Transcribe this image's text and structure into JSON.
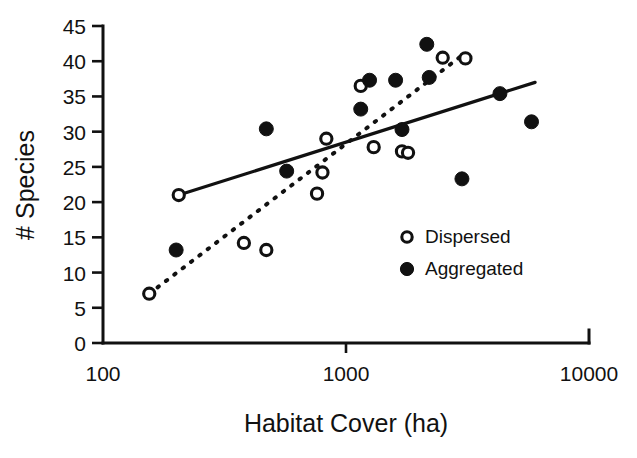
{
  "chart_data": {
    "type": "scatter",
    "title": "",
    "xlabel": "Habitat Cover (ha)",
    "ylabel": "# Species",
    "xscale": "log",
    "xlim": [
      100,
      10000
    ],
    "ylim": [
      0,
      45
    ],
    "xticks": [
      100,
      1000,
      10000
    ],
    "xtick_labels": [
      "100",
      "1000",
      "10000"
    ],
    "yticks": [
      0,
      5,
      10,
      15,
      20,
      25,
      30,
      35,
      40,
      45
    ],
    "ytick_labels": [
      "0",
      "5",
      "10",
      "15",
      "20",
      "25",
      "30",
      "35",
      "40",
      "45"
    ],
    "grid": false,
    "legend_position": "center-right",
    "series": [
      {
        "name": "Dispersed",
        "marker": "open-circle",
        "points": [
          {
            "x": 155,
            "y": 7.0
          },
          {
            "x": 205,
            "y": 21.0
          },
          {
            "x": 380,
            "y": 14.2
          },
          {
            "x": 470,
            "y": 13.2
          },
          {
            "x": 760,
            "y": 21.2
          },
          {
            "x": 800,
            "y": 24.2
          },
          {
            "x": 830,
            "y": 29.0
          },
          {
            "x": 1150,
            "y": 36.5
          },
          {
            "x": 1300,
            "y": 27.8
          },
          {
            "x": 1700,
            "y": 27.2
          },
          {
            "x": 1800,
            "y": 27.0
          },
          {
            "x": 2500,
            "y": 40.5
          },
          {
            "x": 3100,
            "y": 40.4
          }
        ]
      },
      {
        "name": "Aggregated",
        "marker": "filled-circle",
        "points": [
          {
            "x": 200,
            "y": 13.2
          },
          {
            "x": 470,
            "y": 30.4
          },
          {
            "x": 570,
            "y": 24.4
          },
          {
            "x": 1150,
            "y": 33.2
          },
          {
            "x": 1250,
            "y": 37.3
          },
          {
            "x": 1600,
            "y": 37.3
          },
          {
            "x": 1700,
            "y": 30.3
          },
          {
            "x": 2150,
            "y": 42.4
          },
          {
            "x": 2200,
            "y": 37.7
          },
          {
            "x": 3000,
            "y": 23.3
          },
          {
            "x": 4300,
            "y": 35.4
          },
          {
            "x": 5800,
            "y": 31.4
          }
        ]
      }
    ],
    "fits": [
      {
        "name": "Aggregated trend",
        "style": "solid",
        "start": {
          "x": 205,
          "y": 21.0
        },
        "end": {
          "x": 6000,
          "y": 37.0
        }
      },
      {
        "name": "Dispersed trend",
        "style": "dotted",
        "start": {
          "x": 155,
          "y": 7.0
        },
        "end": {
          "x": 3050,
          "y": 41.0
        }
      }
    ]
  },
  "legend": {
    "entries": [
      {
        "label": "Dispersed",
        "marker": "open-circle"
      },
      {
        "label": "Aggregated",
        "marker": "filled-circle"
      }
    ]
  },
  "axes": {
    "x_title": "Habitat Cover (ha)",
    "y_title": "# Species"
  }
}
